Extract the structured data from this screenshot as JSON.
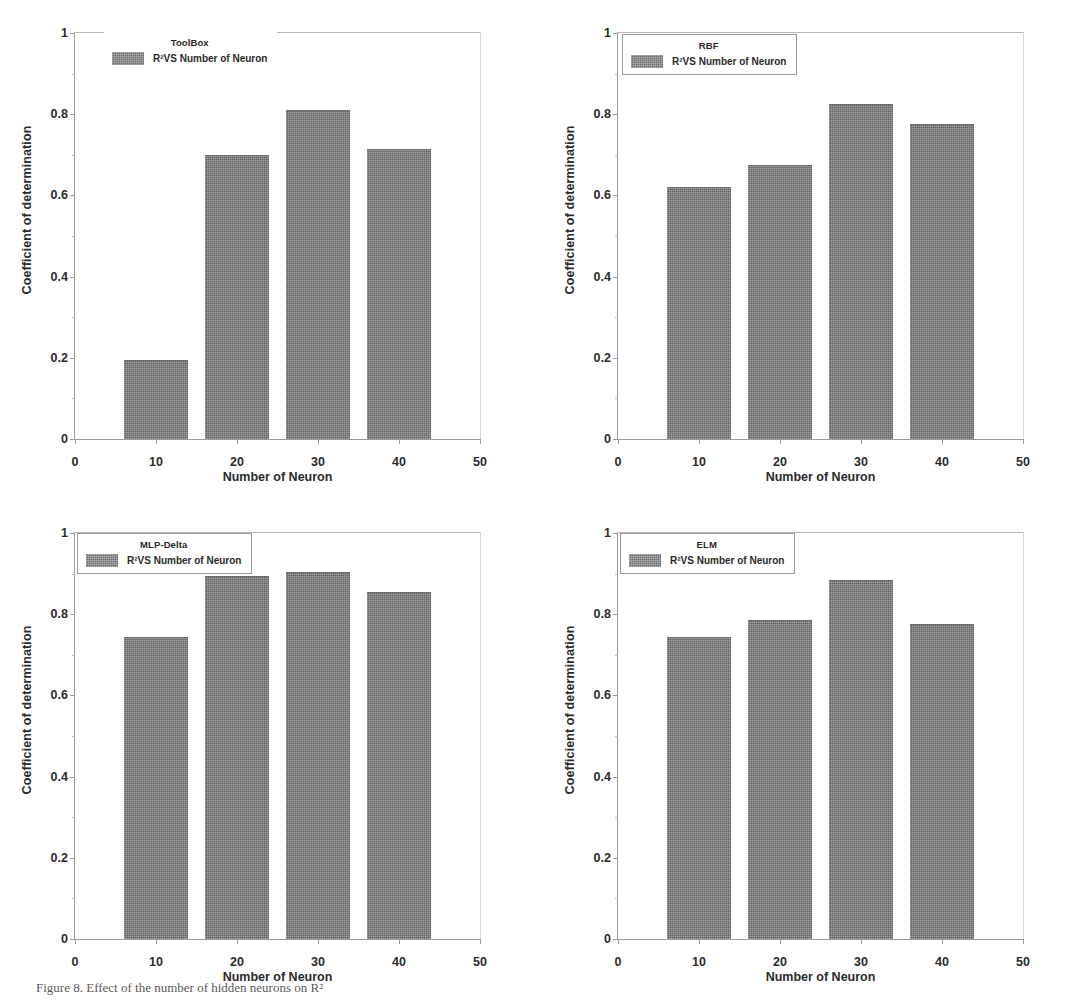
{
  "figure": {
    "caption": "Figure 8. Effect of the number of hidden neurons on R²",
    "panel_count": 4
  },
  "axes": {
    "xlabel": "Number of Neuron",
    "ylabel": "Coefficient of determination",
    "xticks": [
      "0",
      "10",
      "20",
      "30",
      "40",
      "50"
    ],
    "yticks": [
      "0",
      "0.2",
      "0.4",
      "0.6",
      "0.8",
      "1"
    ]
  },
  "legend": {
    "series_label": "R²VS Number of Neuron",
    "swatch_color": "#8a8a8a"
  },
  "chart_data": [
    {
      "type": "bar",
      "title": "ToolBox",
      "panel_index": 0,
      "legend_boxed": false,
      "categories": [
        10,
        20,
        30,
        40
      ],
      "values": [
        0.195,
        0.7,
        0.81,
        0.715
      ],
      "series": [
        {
          "name": "R²VS Number of Neuron",
          "values": [
            0.195,
            0.7,
            0.81,
            0.715
          ]
        }
      ],
      "xlabel": "Number of Neuron",
      "ylabel": "Coefficient of determination",
      "xlim": [
        0,
        50
      ],
      "ylim": [
        0,
        1
      ],
      "xtick_values": [
        0,
        10,
        20,
        30,
        40,
        50
      ],
      "ytick_values": [
        0,
        0.2,
        0.4,
        0.6,
        0.8,
        1
      ],
      "grid": false,
      "legend_position": "top-center"
    },
    {
      "type": "bar",
      "title": "RBF",
      "panel_index": 1,
      "legend_boxed": true,
      "categories": [
        10,
        20,
        30,
        40
      ],
      "values": [
        0.62,
        0.675,
        0.825,
        0.775
      ],
      "series": [
        {
          "name": "R²VS Number of Neuron",
          "values": [
            0.62,
            0.675,
            0.825,
            0.775
          ]
        }
      ],
      "xlabel": "Number of Neuron",
      "ylabel": "Coefficient of determination",
      "xlim": [
        0,
        50
      ],
      "ylim": [
        0,
        1
      ],
      "xtick_values": [
        0,
        10,
        20,
        30,
        40,
        50
      ],
      "ytick_values": [
        0,
        0.2,
        0.4,
        0.6,
        0.8,
        1
      ],
      "grid": false,
      "legend_position": "top-left"
    },
    {
      "type": "bar",
      "title": "MLP-Delta",
      "panel_index": 2,
      "legend_boxed": true,
      "categories": [
        10,
        20,
        30,
        40
      ],
      "values": [
        0.745,
        0.895,
        0.905,
        0.855
      ],
      "series": [
        {
          "name": "R²VS Number of Neuron",
          "values": [
            0.745,
            0.895,
            0.905,
            0.855
          ]
        }
      ],
      "xlabel": "Number of Neuron",
      "ylabel": "Coefficient of determination",
      "xlim": [
        0,
        50
      ],
      "ylim": [
        0,
        1
      ],
      "xtick_values": [
        0,
        10,
        20,
        30,
        40,
        50
      ],
      "ytick_values": [
        0,
        0.2,
        0.4,
        0.6,
        0.8,
        1
      ],
      "grid": false,
      "legend_position": "top-left"
    },
    {
      "type": "bar",
      "title": "ELM",
      "panel_index": 3,
      "legend_boxed": true,
      "categories": [
        10,
        20,
        30,
        40
      ],
      "values": [
        0.745,
        0.785,
        0.885,
        0.775
      ],
      "series": [
        {
          "name": "R²VS Number of Neuron",
          "values": [
            0.745,
            0.785,
            0.885,
            0.775
          ]
        }
      ],
      "xlabel": "Number of Neuron",
      "ylabel": "Coefficient of determination",
      "xlim": [
        0,
        50
      ],
      "ylim": [
        0,
        1
      ],
      "xtick_values": [
        0,
        10,
        20,
        30,
        40,
        50
      ],
      "ytick_values": [
        0,
        0.2,
        0.4,
        0.6,
        0.8,
        1
      ],
      "grid": false,
      "legend_position": "top-left"
    }
  ]
}
